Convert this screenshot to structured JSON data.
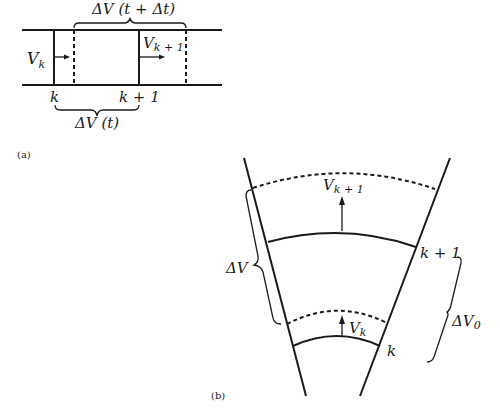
{
  "panel_a": {
    "caption": "(a)",
    "top_brace_label": "ΔV (t + Δt)",
    "bottom_brace_label": "ΔV (t)",
    "velocity_left": {
      "base": "V",
      "sub": "k"
    },
    "velocity_right": {
      "base": "V",
      "sub": "k + 1"
    },
    "node_left": "k",
    "node_right": "k + 1"
  },
  "panel_b": {
    "caption": "(b)",
    "velocity_upper": {
      "base": "V",
      "sub": "k + 1"
    },
    "velocity_lower": {
      "base": "V",
      "sub": "k"
    },
    "node_upper": "k + 1",
    "node_lower": "k",
    "left_brace_label": {
      "base": "ΔV",
      "sub": ""
    },
    "right_brace_label": {
      "base": "ΔV",
      "sub": "0"
    }
  },
  "colors": {
    "ink": "#1a1a1a",
    "background": "#ffffff"
  }
}
